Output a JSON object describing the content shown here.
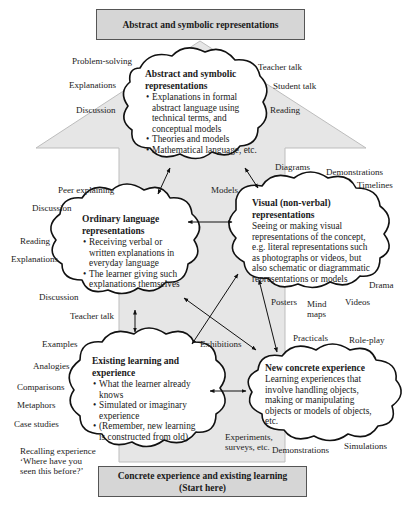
{
  "top_box": {
    "label": "Abstract and symbolic representations"
  },
  "bottom_box": {
    "line1": "Concrete experience and existing learning",
    "line2": "(Start here)"
  },
  "clouds": {
    "abstract": {
      "title1": "Abstract and symbolic",
      "title2": "representations",
      "bullets": [
        "Explanations in formal abstract language using technical terms, and conceptual models",
        "Theories and models",
        "Mathematical language, etc."
      ]
    },
    "ordinary": {
      "title1": "Ordinary language",
      "title2": "representations",
      "bullets": [
        "Receiving verbal or written explanations in everyday language",
        "The learner giving such explanations themselves"
      ]
    },
    "visual": {
      "title1": "Visual (non-verbal)",
      "title2": "representations",
      "body": "Seeing or making visual representations of the concept, e.g. literal representations such as photographs or videos, but also schematic or diagrammatic representations or models"
    },
    "existing": {
      "title1": "Existing learning and",
      "title2": "experience",
      "bullets": [
        "What the learner already knows",
        "Simulated or imaginary experience",
        "(Remember, new learning is constructed from old)"
      ]
    },
    "concrete": {
      "title": "New concrete experience",
      "body": "Learning experiences that involve handling objects, making or manipulating objects or models of objects, etc."
    }
  },
  "labels": {
    "problem_solving": "Problem-solving",
    "explanations_top": "Explanations",
    "discussion_top": "Discussion",
    "teacher_talk_top": "Teacher talk",
    "student_talk": "Student talk",
    "reading_top": "Reading",
    "peer_explaining": "Peer explaining",
    "discussion_mid": "Discussion",
    "reading_mid": "Reading",
    "explanations_mid": "Explanations",
    "discussion_low": "Discussion",
    "teacher_talk_low": "Teacher talk",
    "models": "Models",
    "diagrams": "Diagrams",
    "demonstrations_top": "Demonstrations",
    "timelines": "Timelines",
    "drama": "Drama",
    "posters": "Posters",
    "mind_maps_1": "Mind",
    "mind_maps_2": "maps",
    "videos": "Videos",
    "practicals": "Practicals",
    "role_play": "Role-play",
    "exhibitions": "Exhibitions",
    "examples": "Examples",
    "analogies": "Analogies",
    "comparisons": "Comparisons",
    "metaphors": "Metaphors",
    "case_studies": "Case studies",
    "recalling_1": "Recalling experience",
    "recalling_2": "‘Where have you",
    "recalling_3": "seen this before?’",
    "experiments_1": "Experiments,",
    "experiments_2": "surveys, etc.",
    "demonstrations_low": "Demonstrations",
    "simulations": "Simulations"
  },
  "colors": {
    "arrow_fill": "#e6e6e6",
    "arrow_stroke": "#bdbdbd",
    "box_fill": "#d6d6d6",
    "cloud_stroke": "#111111"
  }
}
